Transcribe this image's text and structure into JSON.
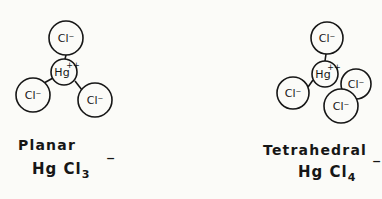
{
  "diagram": {
    "planar": {
      "name": "Planar",
      "formula": {
        "base": "Hg Cl",
        "subscript": "3",
        "charge": "−"
      },
      "atoms": [
        {
          "id": "cl-top",
          "label": "Cl⁻",
          "cx": 66,
          "cy": 38,
          "r": 17
        },
        {
          "id": "hg",
          "label": "Hg",
          "charge": "++",
          "cx": 64,
          "cy": 72,
          "r": 13
        },
        {
          "id": "cl-left",
          "label": "Cl⁻",
          "cx": 33,
          "cy": 95,
          "r": 17
        },
        {
          "id": "cl-right",
          "label": "Cl⁻",
          "cx": 95,
          "cy": 100,
          "r": 17
        }
      ]
    },
    "tetrahedral": {
      "name": "Tetrahedral",
      "formula": {
        "base": "Hg Cl",
        "subscript": "4",
        "charge": "−"
      },
      "atoms": [
        {
          "id": "cl-top",
          "label": "Cl⁻",
          "cx": 327,
          "cy": 38,
          "r": 16
        },
        {
          "id": "hg",
          "label": "Hg",
          "charge": "++",
          "cx": 325,
          "cy": 74,
          "r": 13
        },
        {
          "id": "cl-left",
          "label": "Cl⁻",
          "cx": 293,
          "cy": 93,
          "r": 16
        },
        {
          "id": "cl-back",
          "label": "Cl⁻",
          "cx": 356,
          "cy": 84,
          "r": 15
        },
        {
          "id": "cl-front",
          "label": "Cl⁻",
          "cx": 341,
          "cy": 106,
          "r": 17
        }
      ]
    }
  }
}
